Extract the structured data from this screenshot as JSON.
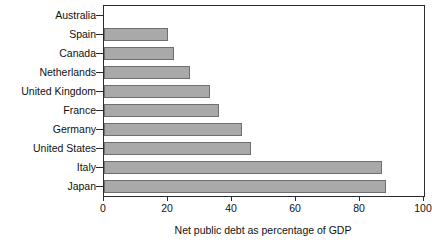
{
  "chart_data": {
    "type": "bar",
    "orientation": "horizontal",
    "title": "",
    "xlabel": "Net public debt as percentage of GDP",
    "ylabel": "",
    "categories": [
      "Australia",
      "Spain",
      "Canada",
      "Netherlands",
      "United Kingdom",
      "France",
      "Germany",
      "United States",
      "Italy",
      "Japan"
    ],
    "values": [
      0,
      20,
      22,
      27,
      33,
      36,
      43,
      46,
      87,
      88
    ],
    "xlim": [
      0,
      100
    ],
    "xticks": [
      0,
      20,
      40,
      60,
      80,
      100
    ],
    "xtick_labels": [
      "0",
      "20",
      "40",
      "60",
      "80",
      "100"
    ],
    "grid": false,
    "legend": null,
    "bar_fill_color": "#a9a9a9",
    "bar_edge_color": "#6f6f6f",
    "axis_color": "#2b2b2b",
    "background_color": "#ffffff"
  }
}
